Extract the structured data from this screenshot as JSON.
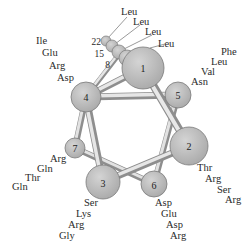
{
  "colors": {
    "circle_fill": "#bdbdbd",
    "circle_stroke": "#7a7a7a",
    "rod_light": "#e6e6e6",
    "rod_dark": "#8c8c8c",
    "text": "#2a2a2a"
  },
  "positions": [
    {
      "id": "1",
      "label": "1"
    },
    {
      "id": "2",
      "label": "2"
    },
    {
      "id": "3",
      "label": "3"
    },
    {
      "id": "4",
      "label": "4"
    },
    {
      "id": "5",
      "label": "5"
    },
    {
      "id": "6",
      "label": "6"
    },
    {
      "id": "7",
      "label": "7"
    }
  ],
  "stacked_numbers": [
    "22",
    "15",
    "8"
  ],
  "residue_groups": {
    "pos1": [
      "Leu",
      "Leu",
      "Leu",
      "Leu"
    ],
    "pos5": [
      "Phe",
      "Leu",
      "Val",
      "Asn"
    ],
    "pos4": [
      "Ile",
      "Glu",
      "Arg",
      "Asp"
    ],
    "pos2": [
      "Thr",
      "Arg",
      "Ser",
      "Arg"
    ],
    "pos7": [
      "Arg",
      "Gln",
      "Thr",
      "Gln"
    ],
    "pos3": [
      "Ser",
      "Lys",
      "Arg",
      "Gly"
    ],
    "pos6": [
      "Asp",
      "Glu",
      "Asp",
      "Arg"
    ]
  }
}
